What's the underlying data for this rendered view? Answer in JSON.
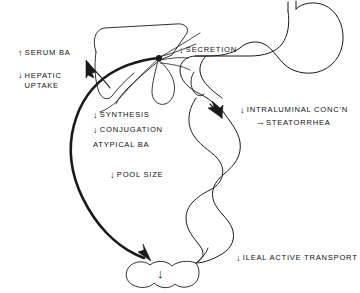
{
  "figure": {
    "background_color": "#ffffff",
    "stroke_color": "#1a1a1a",
    "text_color": "#111111"
  },
  "glyphs": {
    "arrow_up": "↑",
    "arrow_down": "↓",
    "arrow_right": "→"
  },
  "labels": {
    "serum_ba": {
      "arrow": "↑",
      "text": "SERUM BA"
    },
    "hepatic_uptake": {
      "arrow": "↓",
      "line1": "HEPATIC",
      "line2": "UPTAKE"
    },
    "secretion": {
      "arrow": "↓",
      "text": "SECRETION"
    },
    "synthesis": {
      "arrow": "↓",
      "text": "SYNTHESIS"
    },
    "conjugation": {
      "arrow": "↓",
      "text": "CONJUGATION"
    },
    "atypical_ba": {
      "arrow": "",
      "text": "ATYPICAL BA"
    },
    "pool_size": {
      "arrow": "↓",
      "text": "POOL SIZE"
    },
    "intraluminal": {
      "arrow": "↓",
      "text": "INTRALUMINAL CONC'N"
    },
    "steatorrhea": {
      "arrow": "→",
      "text": "STEATORRHEA"
    },
    "ileal_active_transport": {
      "arrow": "↓",
      "text": "ILEAL ACTIVE TRANSPORT"
    },
    "colon_arrow": {
      "arrow": "↓",
      "text": ""
    }
  },
  "organs": [
    {
      "name": "liver",
      "label": "Liver"
    },
    {
      "name": "gallbladder",
      "label": "Gallbladder"
    },
    {
      "name": "stomach",
      "label": "Stomach"
    },
    {
      "name": "duodenum",
      "label": "Duodenum"
    },
    {
      "name": "small-intestine",
      "label": "Small intestine"
    },
    {
      "name": "colon",
      "label": "Colon"
    },
    {
      "name": "portal-circulation",
      "label": "Portal circulation"
    }
  ]
}
